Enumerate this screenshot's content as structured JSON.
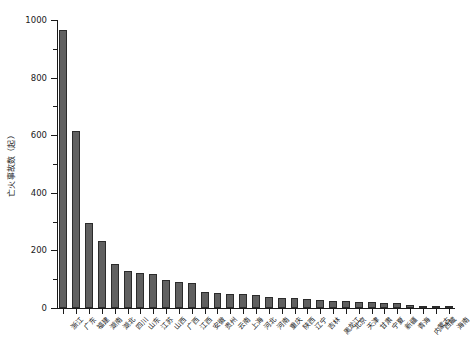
{
  "chart_data": {
    "type": "bar",
    "title": "",
    "xlabel": "",
    "ylabel": "亡火事故数（起）",
    "ylim": [
      0,
      1000
    ],
    "y_major_ticks": [
      0,
      200,
      400,
      600,
      800,
      1000
    ],
    "y_minor_ticks": [
      100,
      300,
      500,
      700,
      900
    ],
    "grid": false,
    "legend": null,
    "categories": [
      "浙江",
      "广东",
      "福建",
      "湖南",
      "湖北",
      "四川",
      "山东",
      "江苏",
      "山西",
      "广西",
      "江西",
      "安徽",
      "贵州",
      "云南",
      "上海",
      "河北",
      "河南",
      "重庆",
      "陕西",
      "辽宁",
      "吉林",
      "黑龙江",
      "北京",
      "天津",
      "甘肃",
      "宁夏",
      "新疆",
      "青海",
      "内蒙古",
      "西藏",
      "海南"
    ],
    "values": [
      965,
      615,
      295,
      232,
      152,
      128,
      120,
      118,
      96,
      92,
      88,
      54,
      52,
      50,
      48,
      46,
      38,
      36,
      34,
      30,
      28,
      26,
      24,
      22,
      20,
      18,
      16,
      12,
      8,
      4,
      2
    ],
    "bar_color": "#606060",
    "bar_edge_color": "#2b2b2b",
    "axis_color": "#1a1a1a",
    "background_color": "#ffffff"
  }
}
